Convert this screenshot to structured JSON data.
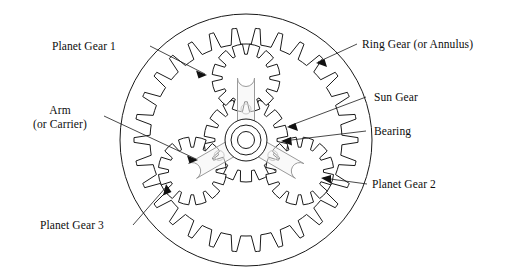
{
  "diagram": {
    "background_color": "#ffffff",
    "line_color": "#1a1a1a",
    "arm_fill_color": "#f4f4f4",
    "arm_stroke_color": "#9a9a9a",
    "center": {
      "x": 246,
      "y": 140
    },
    "ring_outer_radius": 126,
    "ring_root_radius": 112,
    "ring_tip_radius": 96,
    "ring_teeth": 30,
    "sun_teeth": 14,
    "sun_tip_radius": 42,
    "planet_teeth": 12,
    "planet_tip_radius": 34,
    "planet_orbit_radius": 62,
    "planet_angles_deg": [
      -90,
      30,
      150
    ]
  },
  "labels": {
    "planet_gear_1": "Planet Gear 1",
    "arm_line1": "Arm",
    "arm_line2": "(or Carrier)",
    "planet_gear_3": "Planet Gear 3",
    "ring_gear": "Ring Gear (or Annulus)",
    "sun_gear": "Sun Gear",
    "bearing": "Bearing",
    "planet_gear_2": "Planet Gear 2"
  },
  "components": [
    {
      "name": "ring-gear",
      "label": "Ring Gear (or Annulus)",
      "kind": "internal-gear"
    },
    {
      "name": "sun-gear",
      "label": "Sun Gear",
      "kind": "external-gear"
    },
    {
      "name": "bearing",
      "label": "Bearing",
      "kind": "bearing"
    },
    {
      "name": "carrier-arm",
      "label": "Arm (or Carrier)",
      "kind": "carrier"
    },
    {
      "name": "planet-gear-1",
      "label": "Planet Gear 1",
      "kind": "external-gear"
    },
    {
      "name": "planet-gear-2",
      "label": "Planet Gear 2",
      "kind": "external-gear"
    },
    {
      "name": "planet-gear-3",
      "label": "Planet Gear 3",
      "kind": "external-gear"
    }
  ]
}
